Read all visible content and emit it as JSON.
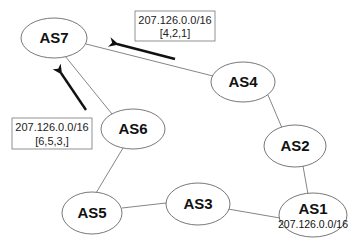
{
  "diagram": {
    "type": "network",
    "nodes": [
      {
        "id": "AS7",
        "label": "AS7",
        "cx": 54,
        "cy": 38,
        "rx": 33,
        "ry": 20
      },
      {
        "id": "AS4",
        "label": "AS4",
        "cx": 243,
        "cy": 82,
        "rx": 32,
        "ry": 20
      },
      {
        "id": "AS6",
        "label": "AS6",
        "cx": 133,
        "cy": 129,
        "rx": 32,
        "ry": 20
      },
      {
        "id": "AS2",
        "label": "AS2",
        "cx": 295,
        "cy": 146,
        "rx": 31,
        "ry": 21
      },
      {
        "id": "AS5",
        "label": "AS5",
        "cx": 92,
        "cy": 213,
        "rx": 30,
        "ry": 21
      },
      {
        "id": "AS3",
        "label": "AS3",
        "cx": 198,
        "cy": 204,
        "rx": 32,
        "ry": 21
      },
      {
        "id": "AS1",
        "label": "AS1",
        "sublabel": "207.126.0.0/16",
        "cx": 313,
        "cy": 215,
        "rx": 34,
        "ry": 22
      }
    ],
    "edges": [
      {
        "from": "AS7",
        "to": "AS4"
      },
      {
        "from": "AS7",
        "to": "AS6"
      },
      {
        "from": "AS4",
        "to": "AS2"
      },
      {
        "from": "AS2",
        "to": "AS1"
      },
      {
        "from": "AS6",
        "to": "AS5"
      },
      {
        "from": "AS5",
        "to": "AS3"
      },
      {
        "from": "AS3",
        "to": "AS1"
      }
    ],
    "advertisements": [
      {
        "prefix": "207.126.0.0/16",
        "path": "[4,2,1]",
        "from": "AS4",
        "to": "AS7"
      },
      {
        "prefix": "207.126.0.0/16",
        "path": "[6,5,3,]",
        "from": "AS6",
        "to": "AS7"
      }
    ]
  }
}
